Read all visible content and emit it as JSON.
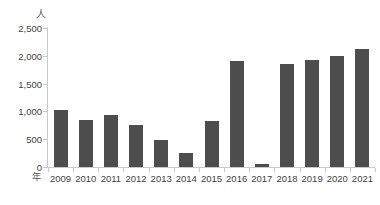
{
  "chart_data": {
    "type": "bar",
    "title": "",
    "xlabel": "年",
    "ylabel": "人",
    "categories": [
      "2009",
      "2010",
      "2011",
      "2012",
      "2013",
      "2014",
      "2015",
      "2016",
      "2017",
      "2018",
      "2019",
      "2020",
      "2021"
    ],
    "values": [
      1020,
      850,
      940,
      760,
      480,
      245,
      830,
      1900,
      50,
      1850,
      1920,
      2000,
      2120
    ],
    "series": [
      {
        "name": "人",
        "values": [
          1020,
          850,
          940,
          760,
          480,
          245,
          830,
          1900,
          50,
          1850,
          1920,
          2000,
          2120
        ]
      }
    ],
    "ylim": [
      0,
      2500
    ],
    "ytick_values": [
      0,
      500,
      1000,
      1500,
      2000,
      2500
    ],
    "ytick_labels": [
      "0",
      "500",
      "1,000",
      "1,500",
      "2,000",
      "2,500"
    ],
    "grid": false,
    "legend": false,
    "legend_position": "none",
    "bar_color": "#4d4d4d",
    "axis_color": "#c9c9c9",
    "text_color": "#3f3f3f"
  }
}
